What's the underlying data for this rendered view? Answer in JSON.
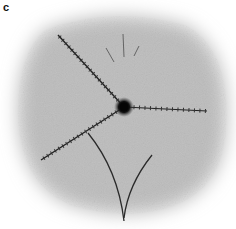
{
  "figure": {
    "panel_label": "c",
    "colors": {
      "background": "#ffffff",
      "field": "#b9b9b9",
      "filament": "#2a2a2a",
      "center_body": "#0a0a0a"
    },
    "elements": {
      "center": {
        "x": 124,
        "y": 107
      },
      "filaments_ticked": [
        {
          "name": "upper-left",
          "from": [
            124,
            107
          ],
          "to": [
            58,
            35
          ]
        },
        {
          "name": "right",
          "from": [
            124,
            107
          ],
          "to": [
            207,
            111
          ]
        },
        {
          "name": "lower-left",
          "from": [
            124,
            107
          ],
          "to": [
            41,
            160
          ]
        }
      ],
      "filaments_faint_top": [
        {
          "from": [
            123,
            34
          ],
          "to": [
            124,
            57
          ]
        },
        {
          "from": [
            106,
            48
          ],
          "to": [
            114,
            62
          ]
        },
        {
          "from": [
            139,
            46
          ],
          "to": [
            134,
            56
          ]
        }
      ],
      "filaments_curved_bottom": [
        {
          "path": "M88 133 Q118 170 124 221"
        },
        {
          "path": "M152 155 Q128 185 124 218"
        }
      ]
    }
  }
}
